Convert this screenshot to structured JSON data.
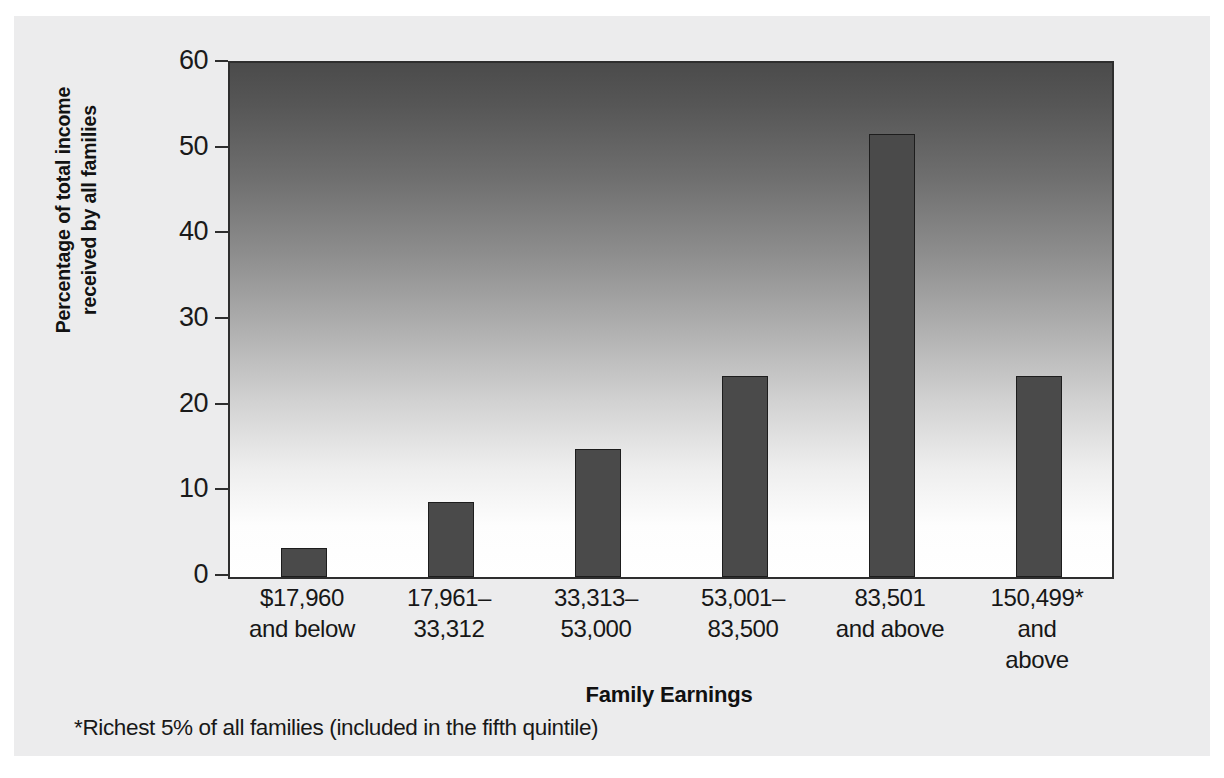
{
  "chart_data": {
    "type": "bar",
    "title": "",
    "xlabel": "Family Earnings",
    "ylabel": "Percentage of total income received by all families",
    "ylabel_line1": "Percentage of total income",
    "ylabel_line2": "received by all families",
    "footnote": "*Richest 5% of all families (included in the fifth quintile)",
    "ylim": [
      0,
      60
    ],
    "yticks": [
      0,
      10,
      20,
      30,
      40,
      50,
      60
    ],
    "ytick_labels": [
      "0",
      "10",
      "20",
      "30",
      "40",
      "50",
      "60"
    ],
    "grid": false,
    "legend": "none",
    "categories": [
      "$17,960 and below",
      "17,961–33,312",
      "33,313–53,000",
      "53,001–83,500",
      "83,501 and above",
      "150,499* and above"
    ],
    "category_lines": [
      [
        "$17,960",
        "and below"
      ],
      [
        "17,961–",
        "33,312"
      ],
      [
        "33,313–",
        "53,000"
      ],
      [
        "53,001–",
        "83,500"
      ],
      [
        "83,501",
        "and above"
      ],
      [
        "150,499*",
        "and",
        "above"
      ]
    ],
    "values": [
      3.4,
      8.7,
      15.0,
      23.5,
      51.7,
      23.5
    ]
  },
  "colors": {
    "bar_fill": "#4a4a4a",
    "bar_stroke": "#1d1d1d",
    "axis": "#2e2e2e",
    "plot_gradient_top": "#4b4b4b",
    "plot_gradient_bottom": "#ffffff",
    "page_background": "#ececed",
    "text": "#171717"
  }
}
